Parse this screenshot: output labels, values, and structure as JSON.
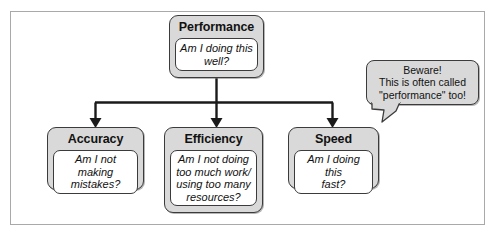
{
  "diagram": {
    "frame": {
      "border_color": "#a9a9a9"
    },
    "colors": {
      "node_fill": "#d9d9d9",
      "node_border": "#3b3b3b",
      "inner_fill": "#ffffff",
      "text": "#111111",
      "connector": "#1a1a1a"
    },
    "root": {
      "title": "Performance",
      "question": "Am I doing this\nwell?"
    },
    "children": [
      {
        "title": "Accuracy",
        "question": "Am I not making\nmistakes?"
      },
      {
        "title": "Efficiency",
        "question": "Am I not doing\ntoo much work/\nusing too many\nresources?"
      },
      {
        "title": "Speed",
        "question": "Am I doing this\nfast?"
      }
    ],
    "callout": {
      "text": "Beware!\nThis is often called\n\"performance\" too!",
      "points_to": "Speed"
    }
  }
}
